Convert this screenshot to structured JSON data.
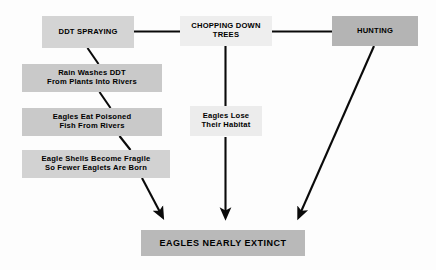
{
  "diagram": {
    "background_color": "#fdfdfd",
    "nodes": {
      "ddt_spraying": {
        "label": "DDT SPRAYING",
        "fill": "#d4d4d4"
      },
      "chopping_down_trees": {
        "label": "CHOPPING DOWN\nTREES",
        "fill": "#eeeeee"
      },
      "hunting": {
        "label": "HUNTING",
        "fill": "#b4b4b4"
      },
      "rain_washes_ddt": {
        "label": "Rain Washes DDT\nFrom Plants Into Rivers",
        "fill": "#c9c9c9"
      },
      "eagles_eat_poisoned_fish": {
        "label": "Eagles Eat Poisoned\nFish From Rivers",
        "fill": "#c9c9c9"
      },
      "eagle_shells_fragile": {
        "label": "Eagle Shells Become Fragile\nSo Fewer Eaglets Are Born",
        "fill": "#d2d2d2"
      },
      "eagles_lose_habitat": {
        "label": "Eagles Lose\nTheir Habitat",
        "fill": "#ececec"
      },
      "eagles_nearly_extinct": {
        "label": "EAGLES NEARLY EXTINCT",
        "fill": "#b9b9b9"
      }
    },
    "edges": [
      {
        "from": "ddt_spraying",
        "to": "chopping_down_trees",
        "style": "line-horizontal"
      },
      {
        "from": "chopping_down_trees",
        "to": "hunting",
        "style": "line-horizontal"
      },
      {
        "from": "ddt_spraying",
        "to": "rain_washes_ddt",
        "style": "line-diagonal"
      },
      {
        "from": "rain_washes_ddt",
        "to": "eagles_eat_poisoned_fish",
        "style": "line-diagonal"
      },
      {
        "from": "eagles_eat_poisoned_fish",
        "to": "eagle_shells_fragile",
        "style": "line-diagonal"
      },
      {
        "from": "eagle_shells_fragile",
        "to": "eagles_nearly_extinct",
        "style": "arrow-diagonal"
      },
      {
        "from": "chopping_down_trees",
        "to": "eagles_lose_habitat",
        "style": "line-vertical"
      },
      {
        "from": "eagles_lose_habitat",
        "to": "eagles_nearly_extinct",
        "style": "arrow-vertical"
      },
      {
        "from": "hunting",
        "to": "eagles_nearly_extinct",
        "style": "arrow-diagonal"
      }
    ],
    "edge_color": "#0a0a0a"
  }
}
